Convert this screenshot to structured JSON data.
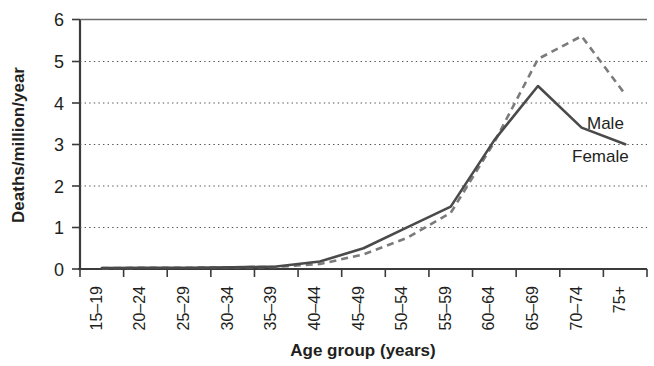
{
  "chart_data": {
    "type": "line",
    "title": "",
    "xlabel": "Age group (years)",
    "ylabel": "Deaths/million/year",
    "categories": [
      "15–19",
      "20–24",
      "25–29",
      "30–34",
      "35–39",
      "40–44",
      "45–49",
      "50–54",
      "55–59",
      "60–64",
      "65–69",
      "70–74",
      "75+"
    ],
    "ylim": [
      0,
      6
    ],
    "yticks": [
      "0",
      "1",
      "2",
      "3",
      "4",
      "5",
      "6"
    ],
    "grid": true,
    "legend_position": "inline-right",
    "series": [
      {
        "name": "Male",
        "style": "dashed",
        "color": "#7b7b7b",
        "values": [
          0.02,
          0.03,
          0.03,
          0.04,
          0.05,
          0.12,
          0.35,
          0.75,
          1.35,
          3.05,
          5.05,
          5.6,
          4.2
        ]
      },
      {
        "name": "Female",
        "style": "solid",
        "color": "#4a4a4a",
        "values": [
          0.02,
          0.03,
          0.03,
          0.04,
          0.06,
          0.18,
          0.5,
          1.0,
          1.5,
          3.1,
          4.4,
          3.4,
          3.0
        ]
      }
    ],
    "annotations": [
      {
        "text": "Male",
        "x_category": "70–74",
        "value": 3.7
      },
      {
        "text": "Female",
        "x_category": "70–74",
        "value": 2.9
      }
    ]
  }
}
